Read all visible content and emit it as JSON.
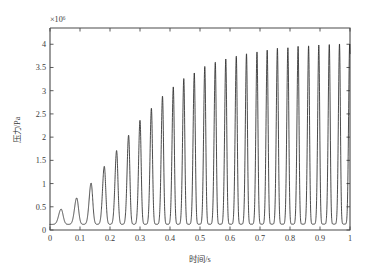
{
  "chart_data": {
    "type": "line",
    "title": "",
    "subtitle": "",
    "xlabel": "时间/s",
    "ylabel": "压力/Pa",
    "y_exponent_label": "×10⁶",
    "y_scale_factor": 1000000,
    "xlim": [
      0,
      1
    ],
    "ylim": [
      0,
      4.35
    ],
    "grid": false,
    "legend": null,
    "legend_position": "none",
    "x_ticks": [
      0,
      0.1,
      0.2,
      0.3,
      0.4,
      0.5,
      0.6,
      0.7,
      0.8,
      0.9,
      1
    ],
    "x_tick_labels": [
      "0",
      "0.1",
      "0.2",
      "0.3",
      "0.4",
      "0.5",
      "0.6",
      "0.7",
      "0.8",
      "0.9",
      "1"
    ],
    "y_ticks": [
      0,
      0.5,
      1,
      1.5,
      2,
      2.5,
      3,
      3.5,
      4
    ],
    "y_tick_labels": [
      "0",
      "0.5",
      "1",
      "1.5",
      "2",
      "2.5",
      "3",
      "3.5",
      "4"
    ],
    "series": [
      {
        "name": "压力",
        "color": "#2b2b2b",
        "baseline_value": 0.12,
        "start_value": 0.13,
        "peaks": [
          {
            "t": 0.037,
            "value": 0.45
          },
          {
            "t": 0.089,
            "value": 0.69
          },
          {
            "t": 0.137,
            "value": 1.01
          },
          {
            "t": 0.181,
            "value": 1.37
          },
          {
            "t": 0.222,
            "value": 1.71
          },
          {
            "t": 0.262,
            "value": 2.04
          },
          {
            "t": 0.3,
            "value": 2.36
          },
          {
            "t": 0.338,
            "value": 2.62
          },
          {
            "t": 0.375,
            "value": 2.88
          },
          {
            "t": 0.411,
            "value": 3.08
          },
          {
            "t": 0.446,
            "value": 3.26
          },
          {
            "t": 0.481,
            "value": 3.38
          },
          {
            "t": 0.516,
            "value": 3.52
          },
          {
            "t": 0.551,
            "value": 3.61
          },
          {
            "t": 0.586,
            "value": 3.68
          },
          {
            "t": 0.621,
            "value": 3.74
          },
          {
            "t": 0.655,
            "value": 3.79
          },
          {
            "t": 0.69,
            "value": 3.83
          },
          {
            "t": 0.724,
            "value": 3.87
          },
          {
            "t": 0.758,
            "value": 3.91
          },
          {
            "t": 0.793,
            "value": 3.92
          },
          {
            "t": 0.827,
            "value": 3.95
          },
          {
            "t": 0.862,
            "value": 3.96
          },
          {
            "t": 0.896,
            "value": 3.98
          },
          {
            "t": 0.931,
            "value": 3.99
          },
          {
            "t": 0.965,
            "value": 4.0
          },
          {
            "t": 0.999,
            "value": 4.0
          }
        ]
      }
    ],
    "annotations": [],
    "peak_count": 27,
    "approx_period_s": 0.0347
  },
  "figure": {
    "background_color": "#ffffff",
    "axis_color": "#4a4a4a",
    "curve_color": "#2b2b2b"
  }
}
